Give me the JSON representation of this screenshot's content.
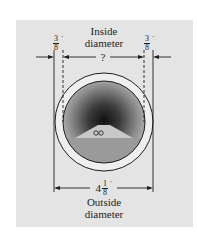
{
  "figure": {
    "inside_label_line1": "Inside",
    "inside_label_line2": "diameter",
    "unknown_value": "?",
    "wall_thickness_left": {
      "numerator": "3",
      "denominator": "8",
      "unit": "′"
    },
    "wall_thickness_right": {
      "numerator": "3",
      "denominator": "8",
      "unit": "′"
    },
    "outside_value": {
      "whole": "4",
      "numerator": "1",
      "denominator": "8",
      "unit": "′"
    },
    "outside_label_line1": "Outside",
    "outside_label_line2": "diameter",
    "icons": [
      "tunnel-pipe-cross-section",
      "car-icon"
    ],
    "colors": {
      "panel": "#e4e4e4",
      "ring": "#efefef",
      "line": "#1e1e1e",
      "floor": "#9a9a9a",
      "road": "#c8c8c8"
    }
  }
}
